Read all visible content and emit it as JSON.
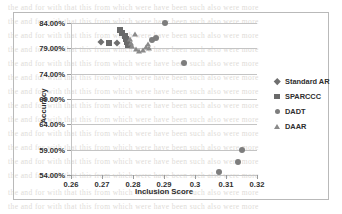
{
  "chart_data": {
    "type": "scatter",
    "title": "",
    "xlabel": "Inclusion Score",
    "ylabel": "Accuracy",
    "xlim": [
      0.26,
      0.32
    ],
    "ylim": [
      0.54,
      0.84
    ],
    "xticks": [
      "0.26",
      "0.27",
      "0.28",
      "0.29",
      "0.3",
      "0.31",
      "0.32"
    ],
    "xtick_values": [
      0.26,
      0.27,
      0.28,
      0.29,
      0.3,
      0.31,
      0.32
    ],
    "yticks": [
      "54.00%",
      "59.00%",
      "64.00%",
      "69.00%",
      "74.00%",
      "79.00%",
      "84.00%"
    ],
    "ytick_values": [
      0.54,
      0.59,
      0.64,
      0.69,
      0.74,
      0.79,
      0.84
    ],
    "grid": "horizontal",
    "legend_position": "right",
    "series": [
      {
        "name": "Standard AR",
        "marker": "diamond",
        "color": "#6f6f6f",
        "points": [
          {
            "x": 0.2697,
            "y": 0.8033
          },
          {
            "x": 0.2748,
            "y": 0.8008
          }
        ]
      },
      {
        "name": "SPARCCC",
        "marker": "square",
        "color": "#6a6a6a",
        "points": [
          {
            "x": 0.2722,
            "y": 0.8014
          },
          {
            "x": 0.2757,
            "y": 0.8255
          },
          {
            "x": 0.2764,
            "y": 0.8198
          },
          {
            "x": 0.2774,
            "y": 0.815
          },
          {
            "x": 0.2778,
            "y": 0.809
          },
          {
            "x": 0.2781,
            "y": 0.803
          },
          {
            "x": 0.2784,
            "y": 0.7975
          }
        ]
      },
      {
        "name": "DADT",
        "marker": "circle",
        "color": "#7d7d7d",
        "points": [
          {
            "x": 0.2862,
            "y": 0.8058
          },
          {
            "x": 0.2875,
            "y": 0.8098
          },
          {
            "x": 0.2902,
            "y": 0.84
          },
          {
            "x": 0.2966,
            "y": 0.7604
          },
          {
            "x": 0.3076,
            "y": 0.546
          },
          {
            "x": 0.3139,
            "y": 0.565
          },
          {
            "x": 0.3151,
            "y": 0.59
          }
        ]
      },
      {
        "name": "DAAR",
        "marker": "triangle",
        "color": "#8a8a8a",
        "points": [
          {
            "x": 0.279,
            "y": 0.8075
          },
          {
            "x": 0.2794,
            "y": 0.801
          },
          {
            "x": 0.2798,
            "y": 0.795
          },
          {
            "x": 0.2806,
            "y": 0.8185
          },
          {
            "x": 0.281,
            "y": 0.7885
          },
          {
            "x": 0.282,
            "y": 0.785
          },
          {
            "x": 0.2833,
            "y": 0.787
          },
          {
            "x": 0.2843,
            "y": 0.793
          },
          {
            "x": 0.2848,
            "y": 0.7985
          },
          {
            "x": 0.2853,
            "y": 0.7905
          }
        ]
      }
    ]
  },
  "legend": {
    "items": [
      {
        "label": "Standard AR",
        "marker": "diamond"
      },
      {
        "label": "SPARCCC",
        "marker": "square"
      },
      {
        "label": "DADT",
        "marker": "circle"
      },
      {
        "label": "DAAR",
        "marker": "triangle"
      }
    ]
  }
}
